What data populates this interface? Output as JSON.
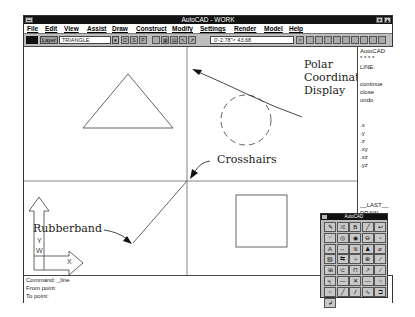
{
  "window": {
    "title": "AutoCAD - WORK",
    "min_glyph": "▼",
    "max_glyph": "▲"
  },
  "menubar": {
    "items": [
      "File",
      "Edit",
      "View",
      "Assist",
      "Draw",
      "Construct",
      "Modify",
      "Settings",
      "Render",
      "Model",
      "Help"
    ]
  },
  "toolbar": {
    "layer_button": "Layer",
    "layer_name": "TRIANGLE",
    "dropdown_glyph": "▾",
    "buttons": [
      "O",
      "S",
      "P",
      "",
      "▦",
      "▤",
      "↖",
      "↗"
    ],
    "coordinates": "0'-2.78\"< 43.68",
    "right_icon": "✧"
  },
  "screen_menu": {
    "items": [
      "AutoCAD",
      "* * * *",
      "LINE:",
      "",
      "continue",
      "close",
      "undo",
      "",
      "",
      "",
      ".x",
      ".y",
      ".z",
      ".xy",
      ".xz",
      ".yz",
      "",
      "",
      "",
      "__LAST__",
      "DRAW",
      "EDIT"
    ]
  },
  "command_line": {
    "lines": [
      "Command: _line",
      "From point:",
      "To point:"
    ]
  },
  "toolbox": {
    "title": "AutoCAD",
    "tools": [
      "✎",
      "⤨",
      "B",
      "╱",
      "↩",
      "◜",
      "◎",
      "◉",
      "⊖",
      "▫",
      "A",
      "↔",
      "≋",
      "♟",
      "⌀",
      "▧",
      "⇆",
      "⌗",
      "⊕",
      "∕",
      "⊞",
      "⊂",
      "⊓",
      "↗",
      "∕",
      "╕",
      "—",
      "✕",
      "—",
      "○",
      "○",
      "╱",
      "⫽",
      "∿",
      "⊐",
      "↲"
    ]
  },
  "annotations": {
    "polar": [
      "Polar",
      "Coordinate",
      "Display"
    ],
    "crosshairs": "Crosshairs",
    "rubberband": "Rubberband"
  },
  "ucs_icon": {
    "y_label": "Y",
    "w_label": "W",
    "x_label": "X"
  }
}
